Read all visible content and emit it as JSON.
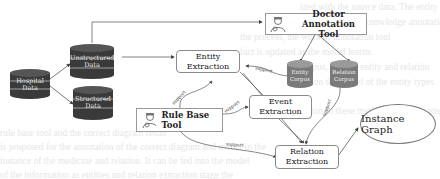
{
  "diagram": {
    "data_sources": [
      {
        "id": "hospital",
        "label": "Hospital Data"
      },
      {
        "id": "unstructured",
        "label": "Unstructured Data"
      },
      {
        "id": "structured",
        "label": "Structured Data"
      }
    ],
    "corpora": [
      {
        "id": "entity_corpus",
        "label": "Entity Corpus"
      },
      {
        "id": "relation_corpus",
        "label": "Relation Corpus"
      }
    ],
    "tools": [
      {
        "id": "doctor_tool",
        "label": "Doctor Annotation Tool",
        "icon": "doctor-icon"
      },
      {
        "id": "rule_tool",
        "label": "Rule Base Tool",
        "icon": "doctor-icon"
      }
    ],
    "processes": [
      {
        "id": "entity_extraction",
        "label": "Entity Extraction"
      },
      {
        "id": "event_extraction",
        "label": "Event Extraction"
      },
      {
        "id": "relation_extraction",
        "label": "Relation Extraction"
      }
    ],
    "output": {
      "id": "instance_graph",
      "label": "Instance Graph"
    },
    "edge_label": "support",
    "colors": {
      "cylinder_dark": "#3a3a3a",
      "cylinder_light": "#8a8a8a",
      "line": "#555555"
    }
  }
}
